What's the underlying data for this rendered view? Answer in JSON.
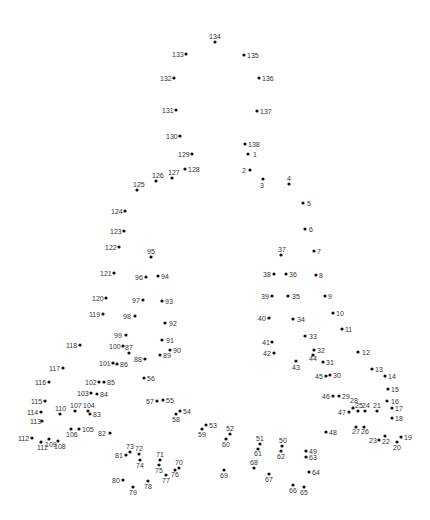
{
  "puzzle": {
    "type": "connect-the-dots",
    "dot_color": "#111111",
    "label_color": "#333333",
    "background": "#ffffff",
    "dots": [
      {
        "n": 1,
        "x": 248,
        "y": 154,
        "lx": 253,
        "ly": 157
      },
      {
        "n": 2,
        "x": 250,
        "y": 170,
        "lx": 242,
        "ly": 173
      },
      {
        "n": 3,
        "x": 263,
        "y": 179,
        "lx": 260,
        "ly": 188
      },
      {
        "n": 4,
        "x": 289,
        "y": 184,
        "lx": 287,
        "ly": 181
      },
      {
        "n": 5,
        "x": 303,
        "y": 203,
        "lx": 307,
        "ly": 206
      },
      {
        "n": 6,
        "x": 305,
        "y": 229,
        "lx": 309,
        "ly": 232
      },
      {
        "n": 7,
        "x": 314,
        "y": 251,
        "lx": 317,
        "ly": 254
      },
      {
        "n": 8,
        "x": 316,
        "y": 275,
        "lx": 319,
        "ly": 278
      },
      {
        "n": 9,
        "x": 325,
        "y": 296,
        "lx": 328,
        "ly": 299
      },
      {
        "n": 10,
        "x": 333,
        "y": 313,
        "lx": 336,
        "ly": 316
      },
      {
        "n": 11,
        "x": 342,
        "y": 329,
        "lx": 345,
        "ly": 332
      },
      {
        "n": 12,
        "x": 358,
        "y": 352,
        "lx": 362,
        "ly": 355
      },
      {
        "n": 13,
        "x": 372,
        "y": 369,
        "lx": 375,
        "ly": 372
      },
      {
        "n": 14,
        "x": 385,
        "y": 376,
        "lx": 388,
        "ly": 379
      },
      {
        "n": 15,
        "x": 388,
        "y": 389,
        "lx": 391,
        "ly": 392
      },
      {
        "n": 16,
        "x": 387,
        "y": 401,
        "lx": 391,
        "ly": 404
      },
      {
        "n": 17,
        "x": 392,
        "y": 408,
        "lx": 395,
        "ly": 411
      },
      {
        "n": 18,
        "x": 392,
        "y": 418,
        "lx": 395,
        "ly": 421
      },
      {
        "n": 19,
        "x": 401,
        "y": 437,
        "lx": 404,
        "ly": 440
      },
      {
        "n": 20,
        "x": 397,
        "y": 442,
        "lx": 393,
        "ly": 450
      },
      {
        "n": 21,
        "x": 377,
        "y": 411,
        "lx": 373,
        "ly": 408
      },
      {
        "n": 22,
        "x": 385,
        "y": 436,
        "lx": 382,
        "ly": 444
      },
      {
        "n": 23,
        "x": 379,
        "y": 440,
        "lx": 369,
        "ly": 443
      },
      {
        "n": 24,
        "x": 365,
        "y": 411,
        "lx": 362,
        "ly": 408
      },
      {
        "n": 25,
        "x": 358,
        "y": 411,
        "lx": 355,
        "ly": 408
      },
      {
        "n": 26,
        "x": 364,
        "y": 427,
        "lx": 361,
        "ly": 434
      },
      {
        "n": 27,
        "x": 356,
        "y": 427,
        "lx": 352,
        "ly": 434
      },
      {
        "n": 28,
        "x": 353,
        "y": 408,
        "lx": 350,
        "ly": 403
      },
      {
        "n": 29,
        "x": 339,
        "y": 396,
        "lx": 342,
        "ly": 399
      },
      {
        "n": 30,
        "x": 330,
        "y": 375,
        "lx": 333,
        "ly": 378
      },
      {
        "n": 31,
        "x": 323,
        "y": 362,
        "lx": 326,
        "ly": 365
      },
      {
        "n": 32,
        "x": 314,
        "y": 350,
        "lx": 317,
        "ly": 353
      },
      {
        "n": 33,
        "x": 305,
        "y": 336,
        "lx": 309,
        "ly": 339
      },
      {
        "n": 34,
        "x": 293,
        "y": 319,
        "lx": 297,
        "ly": 322
      },
      {
        "n": 35,
        "x": 288,
        "y": 296,
        "lx": 292,
        "ly": 299
      },
      {
        "n": 36,
        "x": 286,
        "y": 274,
        "lx": 289,
        "ly": 277
      },
      {
        "n": 37,
        "x": 281,
        "y": 255,
        "lx": 278,
        "ly": 252
      },
      {
        "n": 38,
        "x": 274,
        "y": 274,
        "lx": 263,
        "ly": 277
      },
      {
        "n": 39,
        "x": 272,
        "y": 296,
        "lx": 261,
        "ly": 299
      },
      {
        "n": 40,
        "x": 269,
        "y": 318,
        "lx": 258,
        "ly": 321
      },
      {
        "n": 41,
        "x": 272,
        "y": 342,
        "lx": 262,
        "ly": 345
      },
      {
        "n": 42,
        "x": 274,
        "y": 353,
        "lx": 263,
        "ly": 356
      },
      {
        "n": 43,
        "x": 296,
        "y": 361,
        "lx": 292,
        "ly": 370
      },
      {
        "n": 44,
        "x": 313,
        "y": 355,
        "lx": 309,
        "ly": 361
      },
      {
        "n": 45,
        "x": 326,
        "y": 376,
        "lx": 315,
        "ly": 379
      },
      {
        "n": 46,
        "x": 333,
        "y": 396,
        "lx": 322,
        "ly": 399
      },
      {
        "n": 47,
        "x": 349,
        "y": 412,
        "lx": 338,
        "ly": 415
      },
      {
        "n": 48,
        "x": 326,
        "y": 432,
        "lx": 329,
        "ly": 435
      },
      {
        "n": 49,
        "x": 306,
        "y": 451,
        "lx": 309,
        "ly": 454
      },
      {
        "n": 50,
        "x": 282,
        "y": 446,
        "lx": 279,
        "ly": 443
      },
      {
        "n": 51,
        "x": 260,
        "y": 444,
        "lx": 256,
        "ly": 441
      },
      {
        "n": 52,
        "x": 230,
        "y": 434,
        "lx": 226,
        "ly": 431
      },
      {
        "n": 53,
        "x": 206,
        "y": 425,
        "lx": 209,
        "ly": 428
      },
      {
        "n": 54,
        "x": 180,
        "y": 411,
        "lx": 183,
        "ly": 414
      },
      {
        "n": 55,
        "x": 163,
        "y": 400,
        "lx": 166,
        "ly": 403
      },
      {
        "n": 56,
        "x": 144,
        "y": 378,
        "lx": 147,
        "ly": 381
      },
      {
        "n": 57,
        "x": 157,
        "y": 401,
        "lx": 146,
        "ly": 404
      },
      {
        "n": 58,
        "x": 176,
        "y": 414,
        "lx": 172,
        "ly": 422
      },
      {
        "n": 59,
        "x": 202,
        "y": 429,
        "lx": 198,
        "ly": 437
      },
      {
        "n": 60,
        "x": 226,
        "y": 439,
        "lx": 222,
        "ly": 447
      },
      {
        "n": 61,
        "x": 258,
        "y": 449,
        "lx": 254,
        "ly": 456
      },
      {
        "n": 62,
        "x": 281,
        "y": 451,
        "lx": 277,
        "ly": 459
      },
      {
        "n": 63,
        "x": 306,
        "y": 457,
        "lx": 309,
        "ly": 460
      },
      {
        "n": 64,
        "x": 309,
        "y": 472,
        "lx": 312,
        "ly": 475
      },
      {
        "n": 65,
        "x": 304,
        "y": 487,
        "lx": 300,
        "ly": 495
      },
      {
        "n": 66,
        "x": 293,
        "y": 485,
        "lx": 289,
        "ly": 493
      },
      {
        "n": 67,
        "x": 269,
        "y": 474,
        "lx": 265,
        "ly": 482
      },
      {
        "n": 68,
        "x": 254,
        "y": 468,
        "lx": 250,
        "ly": 465
      },
      {
        "n": 69,
        "x": 224,
        "y": 470,
        "lx": 220,
        "ly": 478
      },
      {
        "n": 70,
        "x": 179,
        "y": 468,
        "lx": 175,
        "ly": 465
      },
      {
        "n": 71,
        "x": 160,
        "y": 460,
        "lx": 156,
        "ly": 457
      },
      {
        "n": 72,
        "x": 139,
        "y": 454,
        "lx": 135,
        "ly": 451
      },
      {
        "n": 73,
        "x": 130,
        "y": 452,
        "lx": 126,
        "ly": 449
      },
      {
        "n": 74,
        "x": 140,
        "y": 460,
        "lx": 136,
        "ly": 468
      },
      {
        "n": 75,
        "x": 159,
        "y": 465,
        "lx": 155,
        "ly": 473
      },
      {
        "n": 76,
        "x": 175,
        "y": 470,
        "lx": 171,
        "ly": 477
      },
      {
        "n": 77,
        "x": 166,
        "y": 475,
        "lx": 162,
        "ly": 483
      },
      {
        "n": 78,
        "x": 148,
        "y": 481,
        "lx": 144,
        "ly": 489
      },
      {
        "n": 79,
        "x": 133,
        "y": 487,
        "lx": 129,
        "ly": 495
      },
      {
        "n": 80,
        "x": 123,
        "y": 480,
        "lx": 112,
        "ly": 483
      },
      {
        "n": 81,
        "x": 126,
        "y": 455,
        "lx": 115,
        "ly": 458
      },
      {
        "n": 82,
        "x": 110,
        "y": 433,
        "lx": 98,
        "ly": 436
      },
      {
        "n": 83,
        "x": 90,
        "y": 414,
        "lx": 93,
        "ly": 417
      },
      {
        "n": 84,
        "x": 97,
        "y": 394,
        "lx": 100,
        "ly": 397
      },
      {
        "n": 85,
        "x": 104,
        "y": 382,
        "lx": 107,
        "ly": 385
      },
      {
        "n": 86,
        "x": 117,
        "y": 364,
        "lx": 120,
        "ly": 367
      },
      {
        "n": 87,
        "x": 129,
        "y": 353,
        "lx": 125,
        "ly": 350
      },
      {
        "n": 88,
        "x": 145,
        "y": 359,
        "lx": 134,
        "ly": 362
      },
      {
        "n": 89,
        "x": 160,
        "y": 355,
        "lx": 163,
        "ly": 358
      },
      {
        "n": 90,
        "x": 170,
        "y": 350,
        "lx": 173,
        "ly": 353
      },
      {
        "n": 91,
        "x": 162,
        "y": 340,
        "lx": 166,
        "ly": 343
      },
      {
        "n": 92,
        "x": 165,
        "y": 323,
        "lx": 169,
        "ly": 326
      },
      {
        "n": 93,
        "x": 162,
        "y": 301,
        "lx": 165,
        "ly": 304
      },
      {
        "n": 94,
        "x": 158,
        "y": 276,
        "lx": 161,
        "ly": 279
      },
      {
        "n": 95,
        "x": 151,
        "y": 257,
        "lx": 147,
        "ly": 254
      },
      {
        "n": 96,
        "x": 146,
        "y": 277,
        "lx": 135,
        "ly": 280
      },
      {
        "n": 97,
        "x": 143,
        "y": 300,
        "lx": 132,
        "ly": 303
      },
      {
        "n": 98,
        "x": 135,
        "y": 316,
        "lx": 123,
        "ly": 319
      },
      {
        "n": 99,
        "x": 126,
        "y": 335,
        "lx": 114,
        "ly": 338
      },
      {
        "n": 100,
        "x": 123,
        "y": 346,
        "lx": 109,
        "ly": 349
      },
      {
        "n": 101,
        "x": 113,
        "y": 363,
        "lx": 99,
        "ly": 366
      },
      {
        "n": 102,
        "x": 99,
        "y": 382,
        "lx": 85,
        "ly": 385
      },
      {
        "n": 103,
        "x": 91,
        "y": 393,
        "lx": 77,
        "ly": 396
      },
      {
        "n": 104,
        "x": 88,
        "y": 411,
        "lx": 83,
        "ly": 408
      },
      {
        "n": 105,
        "x": 79,
        "y": 429,
        "lx": 82,
        "ly": 432
      },
      {
        "n": 106,
        "x": 71,
        "y": 429,
        "lx": 66,
        "ly": 437
      },
      {
        "n": 107,
        "x": 75,
        "y": 411,
        "lx": 70,
        "ly": 408
      },
      {
        "n": 108,
        "x": 58,
        "y": 441,
        "lx": 54,
        "ly": 449
      },
      {
        "n": 109,
        "x": 49,
        "y": 439,
        "lx": 45,
        "ly": 447
      },
      {
        "n": 110,
        "x": 60,
        "y": 414,
        "lx": 55,
        "ly": 411
      },
      {
        "n": 111,
        "x": 41,
        "y": 442,
        "lx": 37,
        "ly": 450
      },
      {
        "n": 112,
        "x": 32,
        "y": 438,
        "lx": 18,
        "ly": 441
      },
      {
        "n": 113,
        "x": 42,
        "y": 421,
        "lx": 30,
        "ly": 424
      },
      {
        "n": 114,
        "x": 41,
        "y": 412,
        "lx": 27,
        "ly": 415
      },
      {
        "n": 115,
        "x": 45,
        "y": 401,
        "lx": 31,
        "ly": 404
      },
      {
        "n": 116,
        "x": 49,
        "y": 382,
        "lx": 35,
        "ly": 385
      },
      {
        "n": 117,
        "x": 63,
        "y": 368,
        "lx": 49,
        "ly": 371
      },
      {
        "n": 118,
        "x": 80,
        "y": 345,
        "lx": 66,
        "ly": 348
      },
      {
        "n": 119,
        "x": 103,
        "y": 314,
        "lx": 89,
        "ly": 317
      },
      {
        "n": 120,
        "x": 106,
        "y": 298,
        "lx": 92,
        "ly": 301
      },
      {
        "n": 121,
        "x": 114,
        "y": 273,
        "lx": 100,
        "ly": 276
      },
      {
        "n": 122,
        "x": 119,
        "y": 247,
        "lx": 105,
        "ly": 250
      },
      {
        "n": 123,
        "x": 124,
        "y": 231,
        "lx": 110,
        "ly": 234
      },
      {
        "n": 124,
        "x": 125,
        "y": 211,
        "lx": 111,
        "ly": 214
      },
      {
        "n": 125,
        "x": 137,
        "y": 190,
        "lx": 133,
        "ly": 187
      },
      {
        "n": 126,
        "x": 156,
        "y": 181,
        "lx": 152,
        "ly": 178
      },
      {
        "n": 127,
        "x": 172,
        "y": 178,
        "lx": 168,
        "ly": 175
      },
      {
        "n": 128,
        "x": 185,
        "y": 169,
        "lx": 188,
        "ly": 172
      },
      {
        "n": 129,
        "x": 192,
        "y": 154,
        "lx": 178,
        "ly": 157
      },
      {
        "n": 130,
        "x": 180,
        "y": 136,
        "lx": 166,
        "ly": 139
      },
      {
        "n": 131,
        "x": 176,
        "y": 110,
        "lx": 162,
        "ly": 113
      },
      {
        "n": 132,
        "x": 174,
        "y": 78,
        "lx": 160,
        "ly": 81
      },
      {
        "n": 133,
        "x": 186,
        "y": 54,
        "lx": 172,
        "ly": 57
      },
      {
        "n": 134,
        "x": 215,
        "y": 42,
        "lx": 209,
        "ly": 39
      },
      {
        "n": 135,
        "x": 244,
        "y": 55,
        "lx": 247,
        "ly": 58
      },
      {
        "n": 136,
        "x": 259,
        "y": 78,
        "lx": 262,
        "ly": 81
      },
      {
        "n": 137,
        "x": 257,
        "y": 111,
        "lx": 260,
        "ly": 114
      },
      {
        "n": 138,
        "x": 245,
        "y": 144,
        "lx": 248,
        "ly": 147
      }
    ]
  }
}
